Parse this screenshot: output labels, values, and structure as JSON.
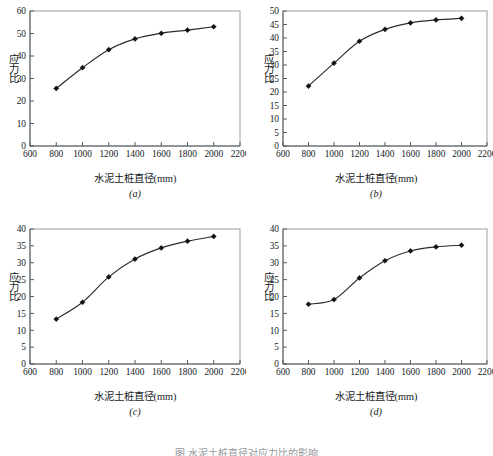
{
  "figure": {
    "caption": "图     水泥土桩直径对应力比的影响",
    "panels": [
      {
        "tag": "(a)",
        "xlabel": "水泥土桩直径(mm)",
        "ylabel": "应力比"
      },
      {
        "tag": "(b)",
        "xlabel": "水泥土桩直径(mm)",
        "ylabel": "应力比"
      },
      {
        "tag": "(c)",
        "xlabel": "水泥土桩直径(mm)",
        "ylabel": "应力比"
      },
      {
        "tag": "(d)",
        "xlabel": "水泥土桩直径(mm)",
        "ylabel": "应力比"
      }
    ]
  },
  "chart_data": [
    {
      "type": "line",
      "panel": "(a)",
      "title": "",
      "xlabel": "水泥土桩直径(mm)",
      "ylabel": "应力比",
      "x": [
        800,
        1000,
        1200,
        1400,
        1600,
        1800,
        2000
      ],
      "values": [
        25.6,
        34.8,
        42.8,
        47.6,
        50.1,
        51.5,
        53.0
      ],
      "xlim": [
        600,
        2200
      ],
      "ylim": [
        0,
        60
      ],
      "xticks": [
        600,
        800,
        1000,
        1200,
        1400,
        1600,
        1800,
        2000,
        2200
      ],
      "yticks": [
        0,
        10,
        20,
        30,
        40,
        50,
        60
      ],
      "grid": false,
      "legend": null,
      "marker": "diamond",
      "color": "#111111"
    },
    {
      "type": "line",
      "panel": "(b)",
      "title": "",
      "xlabel": "水泥土桩直径(mm)",
      "ylabel": "应力比",
      "x": [
        800,
        1000,
        1200,
        1400,
        1600,
        1800,
        2000
      ],
      "values": [
        22.2,
        30.7,
        38.8,
        43.2,
        45.6,
        46.7,
        47.3
      ],
      "xlim": [
        600,
        2200
      ],
      "ylim": [
        0,
        50
      ],
      "xticks": [
        600,
        800,
        1000,
        1200,
        1400,
        1600,
        1800,
        2000,
        2200
      ],
      "yticks": [
        0,
        5,
        10,
        15,
        20,
        25,
        30,
        35,
        40,
        45,
        50
      ],
      "grid": false,
      "legend": null,
      "marker": "diamond",
      "color": "#111111"
    },
    {
      "type": "line",
      "panel": "(c)",
      "title": "",
      "xlabel": "水泥土桩直径(mm)",
      "ylabel": "应力比",
      "x": [
        800,
        1000,
        1200,
        1400,
        1600,
        1800,
        2000
      ],
      "values": [
        13.3,
        18.3,
        25.8,
        31.1,
        34.4,
        36.4,
        37.8
      ],
      "xlim": [
        600,
        2200
      ],
      "ylim": [
        0,
        40
      ],
      "xticks": [
        600,
        800,
        1000,
        1200,
        1400,
        1600,
        1800,
        2000,
        2200
      ],
      "yticks": [
        0,
        5,
        10,
        15,
        20,
        25,
        30,
        35,
        40
      ],
      "grid": false,
      "legend": null,
      "marker": "diamond",
      "color": "#111111"
    },
    {
      "type": "line",
      "panel": "(d)",
      "title": "",
      "xlabel": "水泥土桩直径(mm)",
      "ylabel": "应力比",
      "x": [
        800,
        1000,
        1200,
        1400,
        1600,
        1800,
        2000
      ],
      "values": [
        17.7,
        19.1,
        25.5,
        30.6,
        33.5,
        34.7,
        35.2
      ],
      "xlim": [
        600,
        2200
      ],
      "ylim": [
        0,
        40
      ],
      "xticks": [
        600,
        800,
        1000,
        1200,
        1400,
        1600,
        1800,
        2000,
        2200
      ],
      "yticks": [
        0,
        5,
        10,
        15,
        20,
        25,
        30,
        35,
        40
      ],
      "grid": false,
      "legend": null,
      "marker": "diamond",
      "color": "#111111"
    }
  ]
}
